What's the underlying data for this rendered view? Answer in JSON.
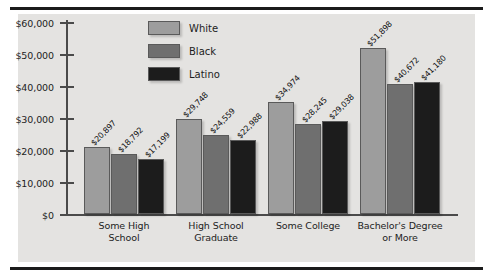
{
  "chart_data": {
    "type": "bar",
    "title": "",
    "subtitle": "",
    "xlabel": "",
    "ylabel": "",
    "ylim": [
      0,
      60000
    ],
    "grid": false,
    "legend_position": "top-center",
    "categories": [
      "Some High School",
      "High School Graduate",
      "Some College",
      "Bachelor's Degree or More"
    ],
    "category_lines": [
      [
        "Some High",
        "School"
      ],
      [
        "High School",
        "Graduate"
      ],
      [
        "Some College",
        ""
      ],
      [
        "Bachelor's Degree",
        "or More"
      ]
    ],
    "series": [
      {
        "name": "White",
        "color": "#9d9d9d",
        "values": [
          20897,
          29748,
          34974,
          51898
        ],
        "labels": [
          "$20,897",
          "$29,748",
          "$34,974",
          "$51,898"
        ]
      },
      {
        "name": "Black",
        "color": "#6f6f6f",
        "values": [
          18792,
          24559,
          28245,
          40672
        ],
        "labels": [
          "$18,792",
          "$24,559",
          "$28,245",
          "$40,672"
        ]
      },
      {
        "name": "Latino",
        "color": "#1c1c1c",
        "values": [
          17199,
          22988,
          29038,
          41180
        ],
        "labels": [
          "$17,199",
          "$22,988",
          "$29,038",
          "$41,180"
        ]
      }
    ],
    "yticks": [
      0,
      10000,
      20000,
      30000,
      40000,
      50000,
      60000
    ],
    "ytick_labels": [
      "$0",
      "$10,000",
      "$20,000",
      "$30,000",
      "$40,000",
      "$50,000",
      "$60,000"
    ]
  },
  "legend": {
    "items": [
      {
        "label": "White"
      },
      {
        "label": "Black"
      },
      {
        "label": "Latino"
      }
    ]
  }
}
